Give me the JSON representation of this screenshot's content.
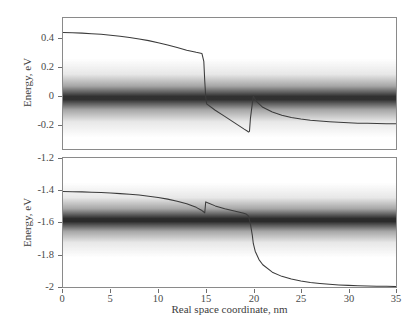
{
  "chart_data": {
    "type": "line",
    "title": "",
    "subtitle": "",
    "xlabel": "Real space coordinate, nm",
    "grid": false,
    "legend": null,
    "panels": [
      {
        "name": "upper-panel",
        "ylabel": "Energy, eV",
        "xlim": [
          0,
          35
        ],
        "ylim": [
          -0.3,
          0.47
        ],
        "xticks": [
          0,
          5,
          10,
          15,
          20,
          25,
          30,
          35
        ],
        "xticklabels": [
          "",
          "",
          "",
          "",
          "",
          "",
          "",
          ""
        ],
        "yticks": [
          0.4,
          0.2,
          0,
          -0.2
        ],
        "yticklabels": [
          "0.4",
          "0.2",
          "0",
          "-0.2"
        ],
        "series": [
          {
            "name": "conduction-band-edge",
            "type": "line",
            "color": "#3b3b3b",
            "x": [
              0,
              1,
              2,
              3,
              4,
              5,
              6,
              7,
              8,
              9,
              10,
              11,
              12,
              13,
              14,
              14.6,
              14.8,
              14.9,
              15.0,
              15.1,
              16,
              17,
              18,
              19,
              19.4,
              19.5,
              19.6,
              19.7,
              20.0,
              20.3,
              21,
              22,
              23,
              24,
              25,
              26,
              27,
              28,
              29,
              30,
              31,
              32,
              33,
              34,
              35
            ],
            "y": [
              0.385,
              0.383,
              0.381,
              0.378,
              0.374,
              0.369,
              0.363,
              0.356,
              0.347,
              0.337,
              0.325,
              0.311,
              0.296,
              0.281,
              0.268,
              0.262,
              0.215,
              0.1,
              0.005,
              -0.035,
              -0.072,
              -0.108,
              -0.145,
              -0.182,
              -0.196,
              -0.2,
              -0.196,
              -0.12,
              0.012,
              -0.018,
              -0.055,
              -0.083,
              -0.102,
              -0.115,
              -0.124,
              -0.131,
              -0.136,
              -0.14,
              -0.143,
              -0.146,
              -0.148,
              -0.149,
              -0.15,
              -0.151,
              -0.152
            ]
          }
        ],
        "bands": [
          {
            "name": "electron-density-band",
            "type": "density-shading",
            "color": "#141414",
            "x_start": 13.0,
            "x_full": 20.0,
            "x_end": 35.0,
            "center": 0.0,
            "half_width": 0.075
          }
        ]
      },
      {
        "name": "lower-panel",
        "ylabel": "Energy, eV",
        "xlim": [
          0,
          35
        ],
        "ylim": [
          -2.0,
          -1.2
        ],
        "xticks": [
          0,
          5,
          10,
          15,
          20,
          25,
          30,
          35
        ],
        "xticklabels": [
          "0",
          "5",
          "10",
          "15",
          "20",
          "25",
          "30",
          "35"
        ],
        "yticks": [
          -1.2,
          -1.4,
          -1.6,
          -1.8,
          -2
        ],
        "yticklabels": [
          "-1.2",
          "-1.4",
          "-1.6",
          "-1.8",
          "-2"
        ],
        "series": [
          {
            "name": "valence-band-edge",
            "type": "line",
            "color": "#3b3b3b",
            "x": [
              0,
              1,
              2,
              3,
              4,
              5,
              6,
              7,
              8,
              9,
              10,
              11,
              12,
              13,
              14,
              14.5,
              14.8,
              14.9,
              15.0,
              15.2,
              16,
              17,
              18,
              19,
              19.3,
              19.5,
              19.7,
              19.9,
              20.0,
              20.2,
              20.6,
              21,
              22,
              23,
              24,
              25,
              26,
              27,
              28,
              29,
              30,
              31,
              32,
              33,
              34,
              35
            ],
            "y": [
              -1.408,
              -1.409,
              -1.41,
              -1.412,
              -1.414,
              -1.417,
              -1.421,
              -1.425,
              -1.43,
              -1.437,
              -1.445,
              -1.455,
              -1.468,
              -1.484,
              -1.506,
              -1.522,
              -1.535,
              -1.54,
              -1.472,
              -1.478,
              -1.497,
              -1.514,
              -1.528,
              -1.543,
              -1.549,
              -1.56,
              -1.61,
              -1.68,
              -1.73,
              -1.778,
              -1.83,
              -1.862,
              -1.908,
              -1.934,
              -1.951,
              -1.963,
              -1.972,
              -1.978,
              -1.983,
              -1.987,
              -1.99,
              -1.992,
              -1.994,
              -1.995,
              -1.996,
              -1.997
            ]
          }
        ],
        "bands": [
          {
            "name": "hole-density-band",
            "type": "density-shading",
            "color": "#141414",
            "x_start": 0.0,
            "x_full": 14.0,
            "x_end": 21.5,
            "center": -1.585,
            "half_width": 0.075
          }
        ]
      }
    ]
  },
  "axes": {
    "ylabel_text": "Energy, eV",
    "xlabel_text": "Real space coordinate, nm"
  },
  "colors": {
    "curve": "#3b3b3b",
    "axis": "#8a8a8a",
    "tick": "#6e6e6e",
    "text": "#3d3d3d",
    "density": "#141414",
    "background": "#ffffff"
  }
}
